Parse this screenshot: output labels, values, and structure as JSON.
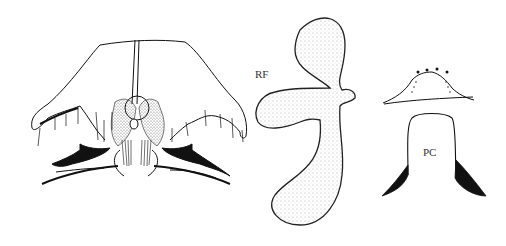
{
  "figure": {
    "type": "anatomical line drawing",
    "panels": [
      {
        "id": "head-ventral-view",
        "label": ""
      },
      {
        "id": "rf",
        "label": "RF"
      },
      {
        "id": "pc",
        "label": "PC"
      }
    ]
  },
  "labels": {
    "rf": "RF",
    "pc": "PC"
  },
  "colors": {
    "ink": "#111111",
    "stipple": "#555555",
    "background": "#ffffff"
  }
}
